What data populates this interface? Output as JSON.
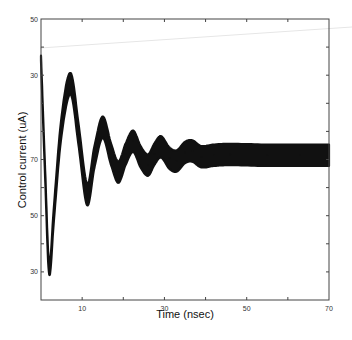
{
  "chart_data": {
    "type": "line",
    "title": "",
    "xlabel": "Time (nsec)",
    "ylabel": "Control current (uA)",
    "xlim": [
      0,
      70
    ],
    "x_ticks": [
      0,
      10,
      20,
      30,
      40,
      50,
      60,
      70
    ],
    "x_tick_labels": [
      {
        "value": 10,
        "label": "10"
      },
      {
        "value": 30,
        "label": "30"
      },
      {
        "value": 50,
        "label": "50"
      },
      {
        "value": 70,
        "label": "70"
      }
    ],
    "y_axis_note": "tick labels as printed (non-monotonic scan); values below are in axis tick-index units, 0 = bottom, 10 = top",
    "ylim": [
      0,
      10
    ],
    "y_ticks": [
      0,
      1,
      2,
      3,
      4,
      5,
      6,
      7,
      8,
      9,
      10
    ],
    "y_tick_labels": [
      {
        "value": 10,
        "label": "50"
      },
      {
        "value": 8,
        "label": "30"
      },
      {
        "value": 5,
        "label": "70"
      },
      {
        "value": 3,
        "label": "50"
      },
      {
        "value": 1,
        "label": "30"
      }
    ],
    "grid": false,
    "legend": "none",
    "series": [
      {
        "name": "Control current",
        "color": "#111111",
        "band_halfwidth": 0.38,
        "points": [
          {
            "x": 0,
            "y": 8.6
          },
          {
            "x": 1.0,
            "y": 4.5
          },
          {
            "x": 2.0,
            "y": 1.1
          },
          {
            "x": 3.2,
            "y": 3.2
          },
          {
            "x": 5.0,
            "y": 6.2
          },
          {
            "x": 7.2,
            "y": 7.7
          },
          {
            "x": 9.2,
            "y": 5.8
          },
          {
            "x": 11.2,
            "y": 3.75
          },
          {
            "x": 13.0,
            "y": 5.1
          },
          {
            "x": 15.0,
            "y": 6.15
          },
          {
            "x": 17.0,
            "y": 5.2
          },
          {
            "x": 18.8,
            "y": 4.55
          },
          {
            "x": 20.6,
            "y": 5.2
          },
          {
            "x": 22.4,
            "y": 5.65
          },
          {
            "x": 24.2,
            "y": 5.1
          },
          {
            "x": 26.0,
            "y": 4.8
          },
          {
            "x": 27.6,
            "y": 5.2
          },
          {
            "x": 29.2,
            "y": 5.45
          },
          {
            "x": 31.2,
            "y": 5.05
          },
          {
            "x": 33.0,
            "y": 4.95
          },
          {
            "x": 35.0,
            "y": 5.25
          },
          {
            "x": 36.8,
            "y": 5.3
          },
          {
            "x": 39.0,
            "y": 5.1
          },
          {
            "x": 42.0,
            "y": 5.15
          },
          {
            "x": 46.0,
            "y": 5.18
          },
          {
            "x": 55.0,
            "y": 5.15
          },
          {
            "x": 63.0,
            "y": 5.15
          },
          {
            "x": 70.0,
            "y": 5.15
          }
        ]
      }
    ]
  }
}
